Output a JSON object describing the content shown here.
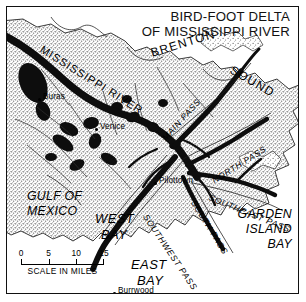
{
  "figure": {
    "kind": "reference-map",
    "title_lines": [
      "BIRD-FOOT DELTA",
      "OF MISSISSIPPI RIVER"
    ]
  },
  "water_bodies": {
    "brenton": "BRENTON",
    "sound": "SOUND",
    "gulf_line1": "GULF OF",
    "gulf_line2": "MEXICO",
    "west_bay_line1": "WEST",
    "west_bay_line2": "BAY",
    "east_bay_line1": "EAST",
    "east_bay_line2": "BAY",
    "garden_line1": "GARDEN",
    "garden_line2": "ISLAND",
    "garden_line3": "BAY"
  },
  "river": {
    "main_label": "MISSISSIPPI RIVER"
  },
  "passes": [
    {
      "label": "MAIN PASS"
    },
    {
      "label": "NORTH PASS"
    },
    {
      "label": "SOUTHEAST PASS"
    },
    {
      "label": "SOUTH PASS"
    },
    {
      "label": "SOUTHWEST PASS"
    }
  ],
  "towns": [
    {
      "name": "Buras"
    },
    {
      "name": "Venice"
    },
    {
      "name": "Pilottown"
    },
    {
      "name": "Burrwood"
    }
  ],
  "scale": {
    "ticks": [
      "0",
      "5",
      "10",
      "15"
    ],
    "caption": "SCALE IN MILES"
  },
  "colors": {
    "ink": "#000000",
    "paper": "#ffffff",
    "land_stipple": "#c9c9c9",
    "channel": "#0d0d0d"
  }
}
